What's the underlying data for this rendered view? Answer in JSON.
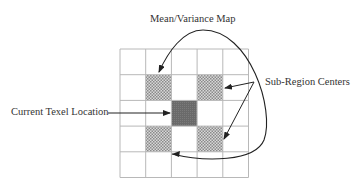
{
  "diagram": {
    "labels": {
      "mean_variance_map": "Mean/Variance Map",
      "sub_region_centers": "Sub-Region Centers",
      "current_texel_location": "Current Texel Location"
    },
    "grid": {
      "rows": 5,
      "cols": 5,
      "x": 120,
      "y": 49,
      "cell": 25.7,
      "line_color": "#b8b8b8",
      "hatched_cells": [
        [
          1,
          1
        ],
        [
          1,
          3
        ],
        [
          3,
          1
        ],
        [
          3,
          3
        ]
      ],
      "center_cell": [
        2,
        2
      ],
      "hatch_color": "#9a9a9a",
      "center_color": "#6e6e6e"
    },
    "arrow_color": "#333333"
  }
}
